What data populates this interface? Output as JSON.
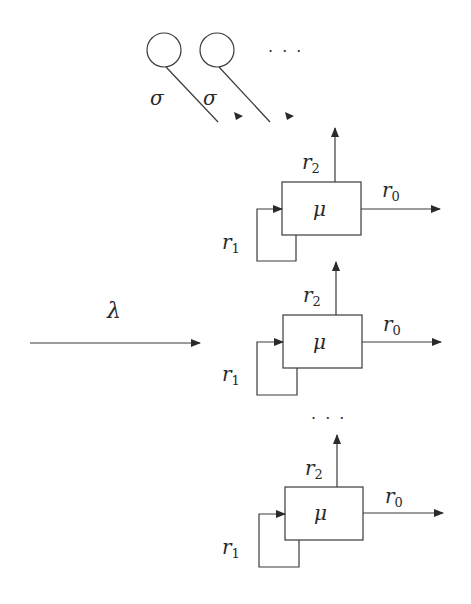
{
  "diagram": {
    "type": "queueing-network",
    "stroke_color": "#3a3a3a",
    "sources": {
      "items": [
        {
          "rate_label": "σ"
        },
        {
          "rate_label": "σ"
        }
      ],
      "ellipsis": "· · ·"
    },
    "arrival": {
      "rate_label": "λ"
    },
    "servers": [
      {
        "service_label": "μ",
        "out_label_main": "r",
        "out_label_sub": "0",
        "up_label_main": "r",
        "up_label_sub": "2",
        "loop_label_main": "r",
        "loop_label_sub": "1"
      },
      {
        "service_label": "μ",
        "out_label_main": "r",
        "out_label_sub": "0",
        "up_label_main": "r",
        "up_label_sub": "2",
        "loop_label_main": "r",
        "loop_label_sub": "1"
      },
      {
        "service_label": "μ",
        "out_label_main": "r",
        "out_label_sub": "0",
        "up_label_main": "r",
        "up_label_sub": "2",
        "loop_label_main": "r",
        "loop_label_sub": "1"
      }
    ],
    "servers_ellipsis": "· · ·"
  }
}
